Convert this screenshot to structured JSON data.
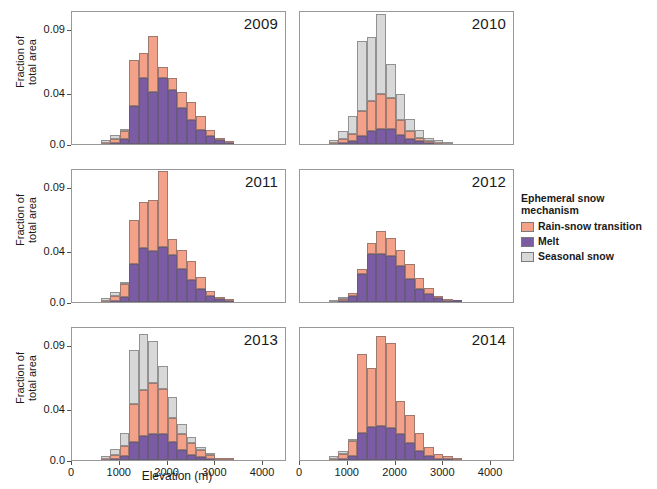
{
  "figure": {
    "xlabel": "Elevation (m)",
    "ylabel_line1": "Fraction of",
    "ylabel_line2": "total area",
    "ytick_labels": [
      "0.0",
      "0.04",
      "0.09"
    ],
    "xtick_labels": [
      "0",
      "1000",
      "2000",
      "3000",
      "4000"
    ]
  },
  "legend": {
    "title": "Ephemeral snow\nmechanism",
    "items": [
      {
        "label": "Rain-snow transition",
        "color": "#f4a189",
        "key": "rain"
      },
      {
        "label": "Melt",
        "color": "#7b5ba3",
        "key": "melt"
      },
      {
        "label": "Seasonal snow",
        "color": "#d8d8d8",
        "key": "seas"
      }
    ]
  },
  "chart_data": {
    "type": "bar",
    "subtype": "stacked-histogram",
    "title": "",
    "xlabel": "Elevation (m)",
    "ylabel": "Fraction of total area",
    "xlim": [
      0,
      4500
    ],
    "ylim": [
      0.0,
      0.105
    ],
    "yticks": [
      0.0,
      0.04,
      0.09
    ],
    "xticks": [
      0,
      1000,
      2000,
      3000,
      4000
    ],
    "grid": false,
    "legend_position": "right",
    "bin_width": 200,
    "bin_centers": [
      700,
      900,
      1100,
      1300,
      1500,
      1700,
      1900,
      2100,
      2300,
      2500,
      2700,
      2900,
      3100,
      3300,
      3500,
      3700
    ],
    "series_names": [
      "Melt",
      "Rain-snow transition",
      "Seasonal snow"
    ],
    "stack_order_bottom_to_top": [
      "Melt",
      "Rain-snow transition",
      "Seasonal snow"
    ],
    "panels": [
      {
        "year": "2009",
        "series": [
          {
            "name": "Melt",
            "values": [
              0.0,
              0.001,
              0.004,
              0.03,
              0.052,
              0.041,
              0.052,
              0.042,
              0.028,
              0.019,
              0.011,
              0.006,
              0.003,
              0.001,
              0.0,
              0.0
            ]
          },
          {
            "name": "Rain-snow transition",
            "values": [
              0.001,
              0.003,
              0.006,
              0.036,
              0.019,
              0.044,
              0.008,
              0.01,
              0.013,
              0.014,
              0.011,
              0.005,
              0.002,
              0.001,
              0.0,
              0.0
            ]
          },
          {
            "name": "Seasonal snow",
            "values": [
              0.002,
              0.003,
              0.001,
              0.0,
              0.0,
              0.0,
              0.0,
              0.0,
              0.0,
              0.0,
              0.0,
              0.0,
              0.0,
              0.0,
              0.0,
              0.0
            ]
          }
        ]
      },
      {
        "year": "2010",
        "series": [
          {
            "name": "Melt",
            "values": [
              0.0,
              0.001,
              0.002,
              0.006,
              0.01,
              0.012,
              0.012,
              0.007,
              0.004,
              0.002,
              0.001,
              0.0,
              0.0,
              0.0,
              0.0,
              0.0
            ]
          },
          {
            "name": "Rain-snow transition",
            "values": [
              0.001,
              0.003,
              0.006,
              0.02,
              0.024,
              0.027,
              0.024,
              0.012,
              0.006,
              0.003,
              0.001,
              0.001,
              0.0,
              0.0,
              0.0,
              0.0
            ]
          },
          {
            "name": "Seasonal snow",
            "values": [
              0.002,
              0.006,
              0.014,
              0.055,
              0.05,
              0.063,
              0.027,
              0.02,
              0.01,
              0.006,
              0.003,
              0.002,
              0.001,
              0.0,
              0.0,
              0.0
            ]
          }
        ]
      },
      {
        "year": "2011",
        "series": [
          {
            "name": "Melt",
            "values": [
              0.0,
              0.001,
              0.004,
              0.03,
              0.042,
              0.04,
              0.043,
              0.037,
              0.026,
              0.017,
              0.01,
              0.005,
              0.002,
              0.001,
              0.0,
              0.0
            ]
          },
          {
            "name": "Rain-snow transition",
            "values": [
              0.001,
              0.004,
              0.01,
              0.034,
              0.036,
              0.04,
              0.06,
              0.012,
              0.015,
              0.015,
              0.01,
              0.004,
              0.002,
              0.001,
              0.0,
              0.0
            ]
          },
          {
            "name": "Seasonal snow",
            "values": [
              0.002,
              0.003,
              0.001,
              0.0,
              0.0,
              0.0,
              0.0,
              0.0,
              0.0,
              0.0,
              0.0,
              0.0,
              0.0,
              0.0,
              0.0,
              0.0
            ]
          }
        ]
      },
      {
        "year": "2012",
        "series": [
          {
            "name": "Melt",
            "values": [
              0.0,
              0.001,
              0.005,
              0.022,
              0.038,
              0.038,
              0.036,
              0.028,
              0.018,
              0.01,
              0.006,
              0.003,
              0.001,
              0.001,
              0.0,
              0.0
            ]
          },
          {
            "name": "Rain-snow transition",
            "values": [
              0.0,
              0.001,
              0.002,
              0.004,
              0.008,
              0.018,
              0.014,
              0.013,
              0.012,
              0.009,
              0.005,
              0.002,
              0.001,
              0.0,
              0.0,
              0.0
            ]
          },
          {
            "name": "Seasonal snow",
            "values": [
              0.001,
              0.001,
              0.0,
              0.0,
              0.0,
              0.0,
              0.0,
              0.0,
              0.0,
              0.0,
              0.0,
              0.0,
              0.0,
              0.0,
              0.0,
              0.0
            ]
          }
        ]
      },
      {
        "year": "2013",
        "series": [
          {
            "name": "Melt",
            "values": [
              0.0,
              0.001,
              0.003,
              0.014,
              0.019,
              0.02,
              0.02,
              0.014,
              0.008,
              0.004,
              0.002,
              0.001,
              0.0,
              0.0,
              0.0,
              0.0
            ]
          },
          {
            "name": "Rain-snow transition",
            "values": [
              0.001,
              0.003,
              0.008,
              0.03,
              0.036,
              0.04,
              0.036,
              0.019,
              0.012,
              0.009,
              0.006,
              0.003,
              0.001,
              0.001,
              0.0,
              0.0
            ]
          },
          {
            "name": "Seasonal snow",
            "values": [
              0.002,
              0.005,
              0.01,
              0.042,
              0.044,
              0.033,
              0.018,
              0.016,
              0.008,
              0.005,
              0.002,
              0.001,
              0.0,
              0.0,
              0.0,
              0.0
            ]
          }
        ]
      },
      {
        "year": "2014",
        "series": [
          {
            "name": "Melt",
            "values": [
              0.0,
              0.001,
              0.003,
              0.021,
              0.026,
              0.027,
              0.025,
              0.02,
              0.013,
              0.007,
              0.003,
              0.001,
              0.001,
              0.0,
              0.0,
              0.0
            ]
          },
          {
            "name": "Rain-snow transition",
            "values": [
              0.001,
              0.004,
              0.012,
              0.062,
              0.046,
              0.07,
              0.067,
              0.026,
              0.022,
              0.014,
              0.007,
              0.004,
              0.002,
              0.001,
              0.0,
              0.0
            ]
          },
          {
            "name": "Seasonal snow",
            "values": [
              0.002,
              0.002,
              0.001,
              0.0,
              0.0,
              0.0,
              0.0,
              0.0,
              0.0,
              0.0,
              0.0,
              0.0,
              0.0,
              0.0,
              0.0,
              0.0
            ]
          }
        ]
      }
    ]
  }
}
